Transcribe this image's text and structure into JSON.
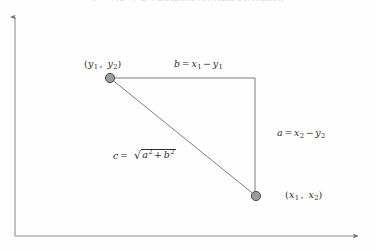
{
  "figure": {
    "clipped_heading": "c = √(a² + b²) distance formula derivation",
    "background_color": "#fefefe",
    "line_color": "#8d8d8d",
    "text_color": "#2e2e2e",
    "point_fill_color": "#9a9a9a",
    "point_stroke_color": "#4a4a4a"
  },
  "axes": {
    "y_axis": {
      "name": "y-axis",
      "x": 15,
      "top": 14,
      "bottom": 236,
      "has_arrowhead": true,
      "arrow_position": "top"
    },
    "x_axis": {
      "name": "x-axis",
      "y": 236,
      "left": 15,
      "right": 362,
      "has_arrowhead": true,
      "arrow_position": "right"
    }
  },
  "points": [
    {
      "id": "point-a",
      "name": "upper-left-vertex",
      "x": 110,
      "y": 78,
      "radius": 5,
      "label_prefix": "(",
      "label_var1": "y",
      "label_sub1": "1",
      "label_sep": ", ",
      "label_var2": "y",
      "label_sub2": "2",
      "label_suffix": ")"
    },
    {
      "id": "point-c",
      "name": "lower-right-vertex",
      "x": 256,
      "y": 196,
      "radius": 5,
      "label_prefix": "(",
      "label_var1": "x",
      "label_sub1": "1",
      "label_sep": ", ",
      "label_var2": "x",
      "label_sub2": "2",
      "label_suffix": ")"
    }
  ],
  "corner": {
    "name": "right-angle-corner",
    "x": 255,
    "y": 78
  },
  "sides": {
    "horizontal": {
      "name": "side-b-horizontal-leg",
      "x1": 110,
      "y1": 78,
      "x2": 255,
      "y2": 78,
      "label_var": "b",
      "equals": "=",
      "term1_var": "x",
      "term1_sub": "1",
      "minus": "−",
      "term2_var": "y",
      "term2_sub": "1"
    },
    "vertical": {
      "name": "side-a-vertical-leg",
      "x1": 255,
      "y1": 78,
      "x2": 255,
      "y2": 196,
      "label_var": "a",
      "equals": "=",
      "term1_var": "x",
      "term1_sub": "2",
      "minus": "−",
      "term2_var": "y",
      "term2_sub": "2"
    },
    "hypotenuse": {
      "name": "side-c-hypotenuse",
      "x1": 110,
      "y1": 78,
      "x2": 256,
      "y2": 196,
      "label_var": "c",
      "equals": "=",
      "radical": "√",
      "rad_term1_var": "a",
      "rad_term1_sup": "2",
      "plus": "+",
      "rad_term2_var": "b",
      "rad_term2_sup": "2"
    }
  }
}
